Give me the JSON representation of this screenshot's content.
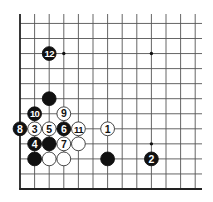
{
  "diagram": {
    "type": "go-board-fragment",
    "corner": "bottom-left",
    "columns_visible": 13,
    "rows_visible": 13,
    "colors": {
      "background": "#ffffff",
      "line": "#555555",
      "border": "#222222",
      "black_stone": "#111111",
      "white_stone": "#ffffff",
      "star_point": "#111111"
    },
    "star_points": [
      {
        "col": 4,
        "row": 10
      },
      {
        "col": 10,
        "row": 10
      },
      {
        "col": 10,
        "row": 4
      }
    ],
    "stones": [
      {
        "color": "white",
        "col": 7,
        "row": 5,
        "label": "1"
      },
      {
        "color": "black",
        "col": 10,
        "row": 3,
        "label": "2"
      },
      {
        "color": "white",
        "col": 2,
        "row": 5,
        "label": "3"
      },
      {
        "color": "black",
        "col": 2,
        "row": 4,
        "label": "4"
      },
      {
        "color": "white",
        "col": 3,
        "row": 5,
        "label": "5"
      },
      {
        "color": "black",
        "col": 4,
        "row": 5,
        "label": "6"
      },
      {
        "color": "white",
        "col": 4,
        "row": 4,
        "label": "7"
      },
      {
        "color": "black",
        "col": 1,
        "row": 5,
        "label": "8"
      },
      {
        "color": "white",
        "col": 4,
        "row": 6,
        "label": "9"
      },
      {
        "color": "black",
        "col": 2,
        "row": 6,
        "label": "10"
      },
      {
        "color": "white",
        "col": 5,
        "row": 5,
        "label": "11"
      },
      {
        "color": "black",
        "col": 3,
        "row": 10,
        "label": "12"
      },
      {
        "color": "black",
        "col": 3,
        "row": 7,
        "label": ""
      },
      {
        "color": "black",
        "col": 3,
        "row": 4,
        "label": ""
      },
      {
        "color": "white",
        "col": 5,
        "row": 4,
        "label": ""
      },
      {
        "color": "black",
        "col": 2,
        "row": 3,
        "label": ""
      },
      {
        "color": "white",
        "col": 3,
        "row": 3,
        "label": ""
      },
      {
        "color": "white",
        "col": 4,
        "row": 3,
        "label": ""
      },
      {
        "color": "black",
        "col": 7,
        "row": 3,
        "label": ""
      }
    ]
  }
}
